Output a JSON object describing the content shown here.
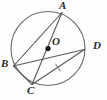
{
  "figure": {
    "kind": "circle-geometry-diagram",
    "width": 107,
    "height": 100,
    "background_color": "#fdfdfd",
    "stroke_color": "#585858",
    "circle_stroke_color": "#6b6b6b",
    "label_color": "#2b2b2b",
    "center_dot_color": "#111111"
  },
  "circle": {
    "name": "main-circle",
    "cx": 48,
    "cy": 48.5,
    "r": 37,
    "stroke_width": 1.1
  },
  "center": {
    "id": "O",
    "label": "O",
    "x": 48,
    "y": 48.5,
    "dot_radius": 2.6,
    "label_x": 52,
    "label_y": 36
  },
  "points": [
    {
      "id": "A",
      "label": "A",
      "x": 62,
      "y": 12.5,
      "label_x": 59,
      "label_y": 0
    },
    {
      "id": "B",
      "label": "B",
      "x": 13.5,
      "y": 66,
      "label_x": 1,
      "label_y": 58
    },
    {
      "id": "C",
      "label": "C",
      "x": 32,
      "y": 84.5,
      "label_x": 27,
      "label_y": 85
    },
    {
      "id": "D",
      "label": "D",
      "x": 84.5,
      "y": 49.5,
      "label_x": 93,
      "label_y": 40
    }
  ],
  "segments": [
    {
      "name": "chord-AB",
      "from": "A",
      "to": "B",
      "x1": 62,
      "y1": 12.5,
      "x2": 13.5,
      "y2": 66,
      "tick": true
    },
    {
      "name": "chord-CD",
      "from": "C",
      "to": "D",
      "x1": 32,
      "y1": 84.5,
      "x2": 84.5,
      "y2": 49.5,
      "tick": true
    },
    {
      "name": "chord-AC",
      "from": "A",
      "to": "C",
      "x1": 62,
      "y1": 12.5,
      "x2": 32,
      "y2": 84.5,
      "tick": false
    },
    {
      "name": "chord-BD",
      "from": "B",
      "to": "D",
      "x1": 13.5,
      "y1": 66,
      "x2": 84.5,
      "y2": 49.5,
      "tick": false
    },
    {
      "name": "chord-BC",
      "from": "B",
      "to": "C",
      "x1": 13.5,
      "y1": 66,
      "x2": 32,
      "y2": 84.5,
      "tick": false
    }
  ],
  "tick_marks": [
    {
      "name": "tick-on-AB",
      "on_segment": "chord-AB",
      "x": 37.5,
      "y": 39.5,
      "angle_deg": 42,
      "length": 9
    },
    {
      "name": "tick-on-CD",
      "on_segment": "chord-CD",
      "x": 58,
      "y": 67.5,
      "angle_deg": -34,
      "length": 9
    }
  ]
}
